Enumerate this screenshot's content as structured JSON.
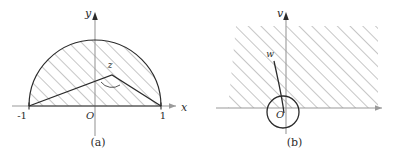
{
  "figure": {
    "stroke_color": "#2b2b2b",
    "axis_color": "#9a9a9a",
    "hatch_color": "#808080",
    "background": "#ffffff"
  },
  "panels": [
    {
      "id": "a",
      "caption": "(a)",
      "axes": {
        "x_label": "x",
        "y_label": "y",
        "origin_label": "O"
      },
      "ticks": [
        {
          "label": "-1",
          "value": -1
        },
        {
          "label": "1",
          "value": 1
        }
      ],
      "region": {
        "name": "upper-half-unit-disk",
        "description": "hatched semicircular region of radius 1 above the real axis"
      },
      "markers": [
        {
          "label": "z",
          "name": "point-z"
        }
      ]
    },
    {
      "id": "b",
      "caption": "(b)",
      "axes": {
        "x_label": "u",
        "y_label": "v",
        "origin_label": "O"
      },
      "ticks": [],
      "region": {
        "name": "upper-half-plane",
        "description": "hatched half-plane above the u axis"
      },
      "markers": [
        {
          "label": "w",
          "name": "point-w"
        }
      ]
    }
  ]
}
